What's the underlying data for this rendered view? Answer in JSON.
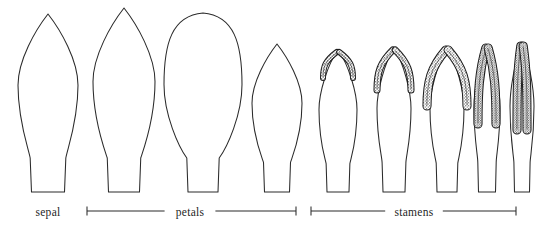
{
  "figure": {
    "background_color": "#ffffff",
    "stroke_color": "#2b2b2b",
    "stipple_color": "#1d1d1d",
    "width": 544,
    "height": 234
  },
  "labels": [
    {
      "id": "sepal",
      "text": "sepal",
      "x": 48,
      "y": 216,
      "has_bracket": false
    },
    {
      "id": "petals",
      "text": "petals",
      "x": 190,
      "y": 216,
      "has_bracket": true,
      "bracket_x1": 87,
      "bracket_x2": 296,
      "bracket_y": 211
    },
    {
      "id": "stamens",
      "text": "stamens",
      "x": 414,
      "y": 216,
      "has_bracket": true,
      "bracket_x1": 311,
      "bracket_x2": 516,
      "bracket_y": 211
    }
  ],
  "organs": [
    {
      "id": "sepal-1",
      "group": "sepal",
      "name": "sepal",
      "apex": "acute",
      "center_x": 48,
      "top_y": 14,
      "base_y": 192,
      "max_width": 60,
      "base_width": 33,
      "anther": null
    },
    {
      "id": "petal-1",
      "group": "petals",
      "name": "petal-outer",
      "apex": "acute",
      "center_x": 124,
      "top_y": 8,
      "base_y": 192,
      "max_width": 62,
      "base_width": 31,
      "anther": null
    },
    {
      "id": "petal-2",
      "group": "petals",
      "name": "petal-broad",
      "apex": "rounded",
      "center_x": 203,
      "top_y": 13,
      "base_y": 192,
      "max_width": 78,
      "base_width": 30,
      "anther": null
    },
    {
      "id": "petal-3",
      "group": "petals",
      "name": "petal-inner",
      "apex": "acute",
      "center_x": 277,
      "top_y": 44,
      "base_y": 192,
      "max_width": 50,
      "base_width": 25,
      "anther": null
    },
    {
      "id": "stamen-1",
      "group": "stamens",
      "name": "stamen-young",
      "center_x": 338,
      "top_y": 50,
      "base_y": 192,
      "max_width": 38,
      "base_width": 22,
      "anther": {
        "style": "short-splayed",
        "lobe_length": 28,
        "spread": 15,
        "top_y": 50,
        "stippled": true
      }
    },
    {
      "id": "stamen-2",
      "group": "stamens",
      "name": "stamen-developing",
      "center_x": 394,
      "top_y": 48,
      "base_y": 192,
      "max_width": 34,
      "base_width": 22,
      "anther": {
        "style": "medium-splayed",
        "lobe_length": 42,
        "spread": 17,
        "top_y": 48,
        "stippled": true
      }
    },
    {
      "id": "stamen-3",
      "group": "stamens",
      "name": "stamen-elongating",
      "center_x": 447,
      "top_y": 48,
      "base_y": 192,
      "max_width": 34,
      "base_width": 20,
      "anther": {
        "style": "long-splayed",
        "lobe_length": 58,
        "spread": 20,
        "top_y": 48,
        "stippled": true
      }
    },
    {
      "id": "stamen-4",
      "group": "stamens",
      "name": "stamen-mature",
      "center_x": 487,
      "top_y": 46,
      "base_y": 192,
      "max_width": 26,
      "base_width": 17,
      "anther": {
        "style": "long-narrow",
        "lobe_length": 78,
        "spread": 9,
        "top_y": 46,
        "stippled": true
      }
    },
    {
      "id": "stamen-5",
      "group": "stamens",
      "name": "stamen-dehiscent",
      "center_x": 522,
      "top_y": 44,
      "base_y": 192,
      "max_width": 24,
      "base_width": 15,
      "anther": {
        "style": "long-parallel",
        "lobe_length": 86,
        "spread": 5,
        "top_y": 44,
        "stippled": true
      }
    }
  ]
}
